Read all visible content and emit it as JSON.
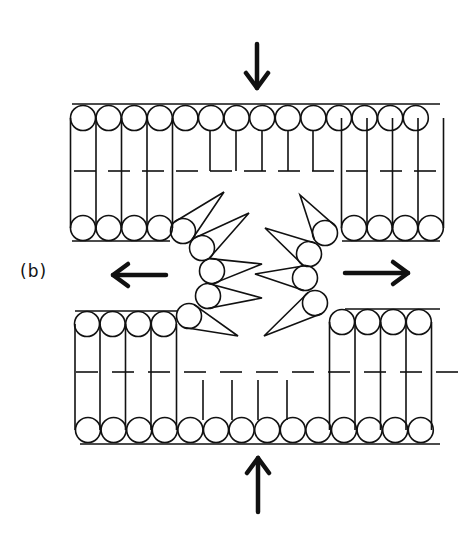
{
  "figure": {
    "panel_label": "(b)",
    "colors": {
      "ink": "#111111",
      "background": "#ffffff"
    },
    "arrows": [
      {
        "name": "compress-down",
        "x1": 257,
        "y1": 44,
        "x2": 257,
        "y2": 88
      },
      {
        "name": "compress-up",
        "x1": 258,
        "y1": 512,
        "x2": 258,
        "y2": 458
      },
      {
        "name": "tension-left",
        "x1": 166,
        "y1": 275,
        "x2": 113,
        "y2": 275
      },
      {
        "name": "tension-right",
        "x1": 345,
        "y1": 273,
        "x2": 408,
        "y2": 273
      }
    ]
  }
}
